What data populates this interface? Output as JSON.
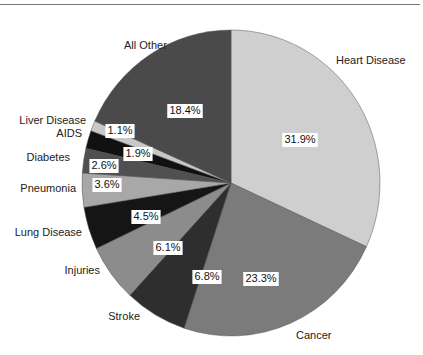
{
  "chart_data": {
    "type": "pie",
    "title": "",
    "start_angle_deg": 0,
    "direction": "clockwise",
    "slices": [
      {
        "label": "Heart Disease",
        "value": 31.9,
        "pct_label": "31.9%",
        "color": "#cfcfcf"
      },
      {
        "label": "Cancer",
        "value": 23.3,
        "pct_label": "23.3%",
        "color": "#7b7b7b"
      },
      {
        "label": "Stroke",
        "value": 6.8,
        "pct_label": "6.8%",
        "color": "#2e2e2e"
      },
      {
        "label": "Injuries",
        "value": 6.1,
        "pct_label": "6.1%",
        "color": "#8c8c8c"
      },
      {
        "label": "Lung Disease",
        "value": 4.5,
        "pct_label": "4.5%",
        "color": "#151515"
      },
      {
        "label": "Pneumonia",
        "value": 3.6,
        "pct_label": "3.6%",
        "color": "#a8a8a8"
      },
      {
        "label": "Diabetes",
        "value": 2.6,
        "pct_label": "2.6%",
        "color": "#505050"
      },
      {
        "label": "AIDS",
        "value": 1.9,
        "pct_label": "1.9%",
        "color": "#111111"
      },
      {
        "label": "Liver Disease",
        "value": 1.1,
        "pct_label": "1.1%",
        "color": "#c8c8c8"
      },
      {
        "label": "All Other",
        "value": 18.4,
        "pct_label": "18.4%",
        "color": "#4a4a4a"
      }
    ]
  },
  "layout": {
    "cx": 231,
    "cy": 183,
    "rx": 149,
    "ry": 153,
    "category_label_positions": [
      {
        "x": 336,
        "y": 64,
        "anchor": "start"
      },
      {
        "x": 296,
        "y": 339,
        "anchor": "start"
      },
      {
        "x": 140,
        "y": 320,
        "anchor": "end"
      },
      {
        "x": 100,
        "y": 274,
        "anchor": "end"
      },
      {
        "x": 82,
        "y": 236,
        "anchor": "end"
      },
      {
        "x": 76,
        "y": 192,
        "anchor": "end"
      },
      {
        "x": 70,
        "y": 161,
        "anchor": "end"
      },
      {
        "x": 82,
        "y": 137,
        "anchor": "end"
      },
      {
        "x": 86,
        "y": 124,
        "anchor": "end"
      },
      {
        "x": 124,
        "y": 49,
        "anchor": "start"
      }
    ],
    "pct_label_positions": [
      {
        "x": 300,
        "y": 140
      },
      {
        "x": 261,
        "y": 279
      },
      {
        "x": 207,
        "y": 277
      },
      {
        "x": 168,
        "y": 248
      },
      {
        "x": 146,
        "y": 217
      },
      {
        "x": 107,
        "y": 185
      },
      {
        "x": 104,
        "y": 166
      },
      {
        "x": 138,
        "y": 154
      },
      {
        "x": 120,
        "y": 131
      },
      {
        "x": 185,
        "y": 111
      }
    ]
  }
}
